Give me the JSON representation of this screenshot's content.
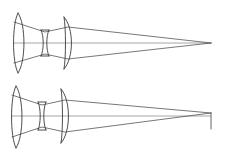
{
  "figure": {
    "background_color": "#ffffff",
    "width": 226,
    "height": 159,
    "colors": {
      "lens_stroke": "#3a3a3a",
      "ray_stroke": "#4a4a4a",
      "axis_stroke": "#8a8a8a",
      "image_plane_stroke": "#555555"
    }
  },
  "chart_data": {
    "type": "line",
    "xlabel": "",
    "ylabel": "",
    "grid": false,
    "legend": "none",
    "xlim": [
      0,
      226
    ],
    "ylim": [
      0,
      159
    ],
    "systems": [
      {
        "name": "upper-optical-system",
        "optical_axis_y": 43,
        "axis_x_start": 14,
        "axis_x_end": 212,
        "focus_point": [
          211,
          43
        ],
        "has_image_plane": false,
        "elements": [
          {
            "name": "lens-1-meniscus",
            "type": "positive-meniscus",
            "x_center": 20,
            "semi_height": 30,
            "front_path": "M 18 13 C 12 24, 12 62, 18 73",
            "back_path": "M 18 13 C 26 24, 26 62, 18 73"
          },
          {
            "name": "lens-2-biconcave",
            "type": "biconcave-negative",
            "x_center": 45,
            "semi_height": 13,
            "front_path": "M 41 30 C 44 36, 44 50, 41 56",
            "back_path": "M 49 30 C 46 36, 46 50, 49 56"
          },
          {
            "name": "lens-3-planoconvex",
            "type": "plano-convex",
            "x_center": 68,
            "semi_height": 26,
            "front_path": "M 64 17 C 66 28, 66 58, 64 69",
            "back_path": "M 64 17 C 74 28, 74 58, 64 69"
          }
        ],
        "rays": [
          {
            "name": "ray-upper-marginal",
            "points": [
              [
                14,
                22
              ],
              [
                45,
                32
              ],
              [
                68,
                27
              ],
              [
                211,
                43
              ]
            ]
          },
          {
            "name": "ray-chief-axial",
            "points": [
              [
                14,
                43
              ],
              [
                45,
                43
              ],
              [
                68,
                43
              ],
              [
                211,
                43
              ]
            ]
          },
          {
            "name": "ray-lower-marginal",
            "points": [
              [
                14,
                63
              ],
              [
                45,
                54
              ],
              [
                68,
                59
              ],
              [
                211,
                43
              ]
            ]
          }
        ]
      },
      {
        "name": "lower-optical-system",
        "optical_axis_y": 116,
        "axis_x_start": 12,
        "axis_x_end": 211,
        "focus_point": [
          211,
          113
        ],
        "has_image_plane": true,
        "image_plane": {
          "x": 211,
          "y_top": 113,
          "y_bottom": 129
        },
        "elements": [
          {
            "name": "lens-1-meniscus",
            "type": "positive-meniscus",
            "x_center": 18,
            "semi_height": 31,
            "front_path": "M 16 86 C 10 97, 10 137, 16 148",
            "back_path": "M 16 86 C 24 97, 24 137, 16 148"
          },
          {
            "name": "lens-2-biconcave",
            "type": "biconcave-negative",
            "x_center": 42,
            "semi_height": 14,
            "front_path": "M 38 102 C 41 108, 41 124, 38 130",
            "back_path": "M 46 102 C 43 108, 43 124, 46 130"
          },
          {
            "name": "lens-3-planoconvex",
            "type": "plano-convex",
            "x_center": 65,
            "semi_height": 27,
            "front_path": "M 61 89 C 63 100, 63 132, 61 143",
            "back_path": "M 61 89 C 71 100, 71 132, 61 143"
          }
        ],
        "rays": [
          {
            "name": "ray-upper-marginal",
            "points": [
              [
                12,
                95
              ],
              [
                42,
                105
              ],
              [
                65,
                100
              ],
              [
                211,
                113
              ]
            ]
          },
          {
            "name": "ray-chief-axial",
            "points": [
              [
                12,
                116
              ],
              [
                42,
                116
              ],
              [
                65,
                116
              ],
              [
                211,
                113
              ]
            ]
          },
          {
            "name": "ray-lower-marginal",
            "points": [
              [
                12,
                137
              ],
              [
                42,
                127
              ],
              [
                65,
                132
              ],
              [
                211,
                113
              ]
            ]
          }
        ]
      }
    ]
  }
}
